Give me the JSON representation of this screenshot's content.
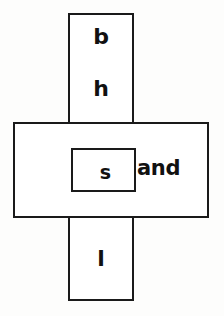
{
  "diagram": {
    "type": "nested-cross-rectangles",
    "background_color": "#fdfdfc",
    "stroke_color": "#1a1a1a",
    "fill_color": "#ffffff",
    "shapes": {
      "vertical_bar": {
        "name": "vertical-rectangle",
        "labels": [
          "b",
          "h",
          "l"
        ]
      },
      "horizontal_bar": {
        "name": "horizontal-rectangle",
        "labels": [
          "and"
        ]
      },
      "inner_box": {
        "name": "inner-small-rectangle",
        "labels": [
          "s"
        ]
      }
    },
    "labels": {
      "top_upper": "b",
      "top_lower": "h",
      "inner": "s",
      "right_of_inner": "and",
      "bottom": "l"
    }
  }
}
